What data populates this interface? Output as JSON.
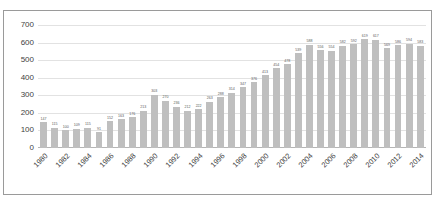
{
  "chart_data": {
    "type": "bar",
    "title": "",
    "subtitle": "",
    "xlabel": "",
    "ylabel": "",
    "ylim": [
      0,
      700
    ],
    "yticks": [
      0,
      100,
      200,
      300,
      400,
      500,
      600,
      700
    ],
    "ytick_labels": [
      "0",
      "100",
      "200",
      "300",
      "400",
      "500",
      "600",
      "700"
    ],
    "grid": true,
    "legend": false,
    "legend_position": "none",
    "bar_color": "#bfbfbf",
    "gridline_color": "#e2e2e2",
    "label_color": "#5a5a5a",
    "axis_text_color": "#3f3f3f",
    "xtick_step": 2,
    "xtick_rotation": -45,
    "categories": [
      "1980",
      "1981",
      "1982",
      "1983",
      "1984",
      "1985",
      "1986",
      "1987",
      "1988",
      "1989",
      "1990",
      "1991",
      "1992",
      "1993",
      "1994",
      "1995",
      "1996",
      "1997",
      "1998",
      "1999",
      "2000",
      "2001",
      "2002",
      "2003",
      "2004",
      "2005",
      "2006",
      "2007",
      "2008",
      "2009",
      "2010",
      "2011",
      "2012",
      "2013",
      "2014"
    ],
    "xtick_labels": [
      "1980",
      "",
      "1982",
      "",
      "1984",
      "",
      "1986",
      "",
      "1988",
      "",
      "1990",
      "",
      "1992",
      "",
      "1994",
      "",
      "1996",
      "",
      "1998",
      "",
      "2000",
      "",
      "2002",
      "",
      "2004",
      "",
      "2006",
      "",
      "2008",
      "",
      "2010",
      "",
      "2012",
      "",
      "2014"
    ],
    "values": [
      147,
      115,
      100,
      109,
      115,
      91,
      152,
      163,
      176,
      213,
      303,
      270,
      236,
      212,
      222,
      263,
      288,
      314,
      347,
      376,
      413,
      454,
      478,
      539,
      588,
      556,
      554,
      582,
      592,
      619,
      617,
      569,
      586,
      594,
      583
    ],
    "data_labels": [
      "147",
      "115",
      "100",
      "109",
      "115",
      "91",
      "152",
      "163",
      "176",
      "213",
      "303",
      "270",
      "236",
      "212",
      "222",
      "263",
      "288",
      "314",
      "347",
      "376",
      "413",
      "454",
      "478",
      "539",
      "588",
      "556",
      "554",
      "582",
      "592",
      "619",
      "617",
      "569",
      "586",
      "594",
      "583"
    ]
  }
}
